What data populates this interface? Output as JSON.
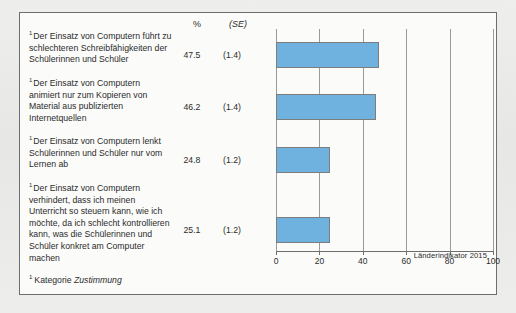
{
  "figure": {
    "background_color": "#e9e9e7",
    "panel_color": "#fbfbfa",
    "border_color": "#6e6e6e",
    "bar_color": "#6fb2e0",
    "bar_border_color": "#7d7d7d",
    "gridline_color": "#9a9a9a"
  },
  "columns": {
    "percent_header": "%",
    "se_header": "(SE)"
  },
  "footer": {
    "footnote_marker": "1",
    "footnote_prefix": "Kategorie ",
    "footnote_italic": "Zustimmung",
    "source": "Länderindikator 2015"
  },
  "chart_data": {
    "type": "bar",
    "orientation": "horizontal",
    "title": "",
    "subtitle": "",
    "xlabel": "",
    "ylabel": "",
    "xlim": [
      0,
      100
    ],
    "xticks": [
      0,
      20,
      40,
      60,
      80,
      100
    ],
    "xticklabels": [
      "0",
      "20",
      "40",
      "60",
      "80",
      "100"
    ],
    "grid": true,
    "grid_axis": "x",
    "legend": false,
    "legend_position": "none",
    "categories": [
      "Der Einsatz von Computern führt zu schlechteren Schreibfähigkeiten der Schülerinnen und Schüler",
      "Der Einsatz von Computern animiert nur zum Kopieren von Material aus publizierten Internetquellen",
      "Der Einsatz von Computern lenkt Schülerinnen und Schüler nur vom Lernen ab",
      "Der Einsatz von Computern verhindert, dass ich meinen Unterricht so steuern kann, wie ich möchte, da ich schlecht kontrollieren kann, was die Schülerinnen und Schüler konkret am Computer machen"
    ],
    "values": [
      47.5,
      46.2,
      24.8,
      25.1
    ],
    "value_labels": [
      "47.5",
      "46.2",
      "24.8",
      "25.1"
    ],
    "standard_errors": [
      1.4,
      1.4,
      1.2,
      1.2
    ],
    "se_labels": [
      "(1.4)",
      "(1.4)",
      "(1.2)",
      "(1.2)"
    ],
    "category_markers": [
      "1",
      "1",
      "1",
      "1"
    ]
  },
  "rows": [
    {
      "marker": "1",
      "label": "Der Einsatz von Computern führt zu schlechteren Schreibfähigkeiten der Schülerinnen und Schüler",
      "percent": "47.5",
      "se": "(1.4)",
      "value": 47.5,
      "height_px": 47
    },
    {
      "marker": "1",
      "label": "Der Einsatz von Computern animiert nur zum Kopieren von Material aus publizierten Internetquellen",
      "percent": "46.2",
      "se": "(1.4)",
      "value": 46.2,
      "height_px": 58
    },
    {
      "marker": "1",
      "label": "Der Einsatz von Computern lenkt Schülerinnen und Schüler nur vom Lernen ab",
      "percent": "24.8",
      "se": "(1.2)",
      "value": 24.8,
      "height_px": 47
    },
    {
      "marker": "1",
      "label": "Der Einsatz von Computern verhindert, dass ich meinen Unterricht so steuern kann, wie ich möchte, da ich schlecht kontrollieren kann, was die Schülerinnen und Schüler konkret am Computer machen",
      "percent": "25.1",
      "se": "(1.2)",
      "value": 25.1,
      "height_px": 93
    }
  ]
}
